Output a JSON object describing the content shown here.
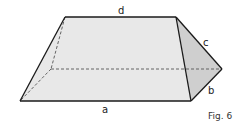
{
  "figure": {
    "caption": "Fig. 6",
    "labels": {
      "a": "a",
      "b": "b",
      "c": "c",
      "d": "d"
    },
    "colors": {
      "front_face": "#e8e8e8",
      "side_face": "#cfcfcf",
      "edge": "#1a1a1a",
      "hidden_edge": "#555555"
    },
    "vertices": {
      "top_left": [
        65,
        17
      ],
      "top_right": [
        176,
        17
      ],
      "bottom_left": [
        20,
        101
      ],
      "bottom_right": [
        191,
        101
      ],
      "right_tip": [
        222,
        69
      ],
      "hidden_back": [
        51,
        69
      ]
    }
  }
}
